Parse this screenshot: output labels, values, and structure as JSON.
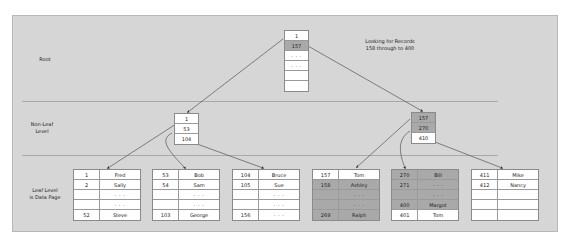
{
  "levels": {
    "root": "Root",
    "non_leaf_line1": "Non-Leaf",
    "non_leaf_line2": "Level",
    "leaf_line1": "Leaf Level",
    "leaf_line2": "is Data Page"
  },
  "note": {
    "line1": "Looking for Records",
    "line2": "158 through to 400"
  },
  "colors": {
    "panel": "#d6d6d6",
    "highlight": "#a9a9a9",
    "cell": "#ffffff"
  },
  "root_node": {
    "cells": [
      {
        "text": "1",
        "hl": false
      },
      {
        "text": "157",
        "hl": true
      },
      {
        "text": "· · ·",
        "hl": false
      },
      {
        "text": "· · ·",
        "hl": false
      },
      {
        "text": "",
        "hl": false
      },
      {
        "text": "",
        "hl": false
      }
    ]
  },
  "non_leaf_nodes": [
    {
      "cells": [
        {
          "text": "1",
          "hl": false
        },
        {
          "text": "53",
          "hl": false
        },
        {
          "text": "104",
          "hl": false
        }
      ]
    },
    {
      "cells": [
        {
          "text": "157",
          "hl": true
        },
        {
          "text": "270",
          "hl": true
        },
        {
          "text": "410",
          "hl": false
        }
      ]
    }
  ],
  "leaf_pages": [
    {
      "rows": [
        {
          "k": "1",
          "v": "Fred",
          "hl": false
        },
        {
          "k": "2",
          "v": "Sally",
          "hl": false
        },
        {
          "k": "",
          "v": "· · ·",
          "hl": false
        },
        {
          "k": "",
          "v": "· · ·",
          "hl": false
        },
        {
          "k": "52",
          "v": "Steve",
          "hl": false
        }
      ]
    },
    {
      "rows": [
        {
          "k": "53",
          "v": "Bob",
          "hl": false
        },
        {
          "k": "54",
          "v": "Sam",
          "hl": false
        },
        {
          "k": "",
          "v": "· · ·",
          "hl": false
        },
        {
          "k": "",
          "v": "· · ·",
          "hl": false
        },
        {
          "k": "103",
          "v": "George",
          "hl": false
        }
      ]
    },
    {
      "rows": [
        {
          "k": "104",
          "v": "Bruce",
          "hl": false
        },
        {
          "k": "105",
          "v": "Sue",
          "hl": false
        },
        {
          "k": "",
          "v": "· · ·",
          "hl": false
        },
        {
          "k": "",
          "v": "· · ·",
          "hl": false
        },
        {
          "k": "156",
          "v": "· · ·",
          "hl": false
        }
      ]
    },
    {
      "rows": [
        {
          "k": "157",
          "v": "Tom",
          "hl": false
        },
        {
          "k": "158",
          "v": "Ashley",
          "hl": true
        },
        {
          "k": "",
          "v": "· · ·",
          "hl": true
        },
        {
          "k": "",
          "v": "· · ·",
          "hl": true
        },
        {
          "k": "269",
          "v": "Ralph",
          "hl": true
        }
      ]
    },
    {
      "rows": [
        {
          "k": "270",
          "v": "Bill",
          "hl": true
        },
        {
          "k": "271",
          "v": "· · ·",
          "hl": true
        },
        {
          "k": "",
          "v": "· · ·",
          "hl": true
        },
        {
          "k": "400",
          "v": "Margot",
          "hl": true
        },
        {
          "k": "401",
          "v": "Tom",
          "hl": false
        }
      ]
    },
    {
      "rows": [
        {
          "k": "411",
          "v": "Mike",
          "hl": false
        },
        {
          "k": "412",
          "v": "Nancy",
          "hl": false
        },
        {
          "k": "",
          "v": "",
          "hl": false
        },
        {
          "k": "",
          "v": "",
          "hl": false
        },
        {
          "k": "",
          "v": "",
          "hl": false
        }
      ]
    }
  ]
}
